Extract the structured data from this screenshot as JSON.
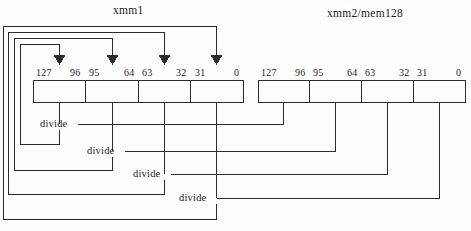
{
  "diagram": {
    "title_left": "xmm1",
    "title_right": "xmm2/mem128",
    "operation_label": "divide",
    "colors": {
      "line": "#2b2b2b",
      "text": "#1d1d1d",
      "background": "#fdfdfd"
    },
    "registers": [
      {
        "name": "xmm1",
        "role": "destination",
        "bit_labels": [
          "127",
          "96",
          "95",
          "64",
          "63",
          "32",
          "31",
          "0"
        ],
        "lanes": [
          {
            "high": "127",
            "low": "96"
          },
          {
            "high": "95",
            "low": "64"
          },
          {
            "high": "63",
            "low": "32"
          },
          {
            "high": "31",
            "low": "0"
          }
        ]
      },
      {
        "name": "xmm2/mem128",
        "role": "source",
        "bit_labels": [
          "127",
          "96",
          "95",
          "64",
          "63",
          "32",
          "31",
          "0"
        ],
        "lanes": [
          {
            "high": "127",
            "low": "96"
          },
          {
            "high": "95",
            "low": "64"
          },
          {
            "high": "63",
            "low": "32"
          },
          {
            "high": "31",
            "low": "0"
          }
        ]
      }
    ],
    "operations": [
      {
        "index": 1,
        "label": "divide",
        "dest_lane": "127-96",
        "src_lane": "127-96"
      },
      {
        "index": 2,
        "label": "divide",
        "dest_lane": "95-64",
        "src_lane": "95-64"
      },
      {
        "index": 3,
        "label": "divide",
        "dest_lane": "63-32",
        "src_lane": "63-32"
      },
      {
        "index": 4,
        "label": "divide",
        "dest_lane": "31-0",
        "src_lane": "31-0"
      }
    ]
  }
}
